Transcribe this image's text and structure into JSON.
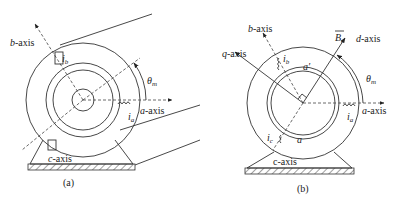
{
  "panel_a": {
    "caption": "(a)",
    "axes": {
      "a_axis": "a-axis",
      "b_axis": "b-axis",
      "c_axis": "c-axis"
    },
    "currents": {
      "ia": "i",
      "ia_sub": "a",
      "ib": "i",
      "ib_sub": "b"
    },
    "angle": {
      "theta": "θ",
      "theta_sub": "m"
    }
  },
  "panel_b": {
    "caption": "(b)",
    "axes": {
      "a_axis": "a-axis",
      "b_axis": "b-axis",
      "c_axis": "c-axis",
      "d_axis": "d-axis",
      "q_axis": "q-axis"
    },
    "field": {
      "B": "B",
      "B_sub": "r"
    },
    "conductors": {
      "a": "a",
      "a_prime": "a′"
    },
    "currents": {
      "ia": "i",
      "ia_sub": "a",
      "ib": "i",
      "ib_sub": "b",
      "ic": "i",
      "ic_sub": "c"
    },
    "angle": {
      "theta": "θ",
      "theta_sub": "m"
    }
  }
}
